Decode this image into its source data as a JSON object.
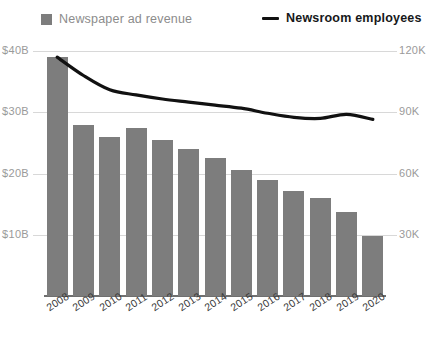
{
  "legend": {
    "bars": {
      "label": "Newspaper ad revenue",
      "icon": "square-swatch-icon",
      "color": "#7d7d7d"
    },
    "line": {
      "label": "Newsroom employees",
      "icon": "line-dash-icon",
      "color": "#111111"
    }
  },
  "axes": {
    "left": {
      "ticks": [
        "$40B",
        "$30B",
        "$20B",
        "$10B"
      ]
    },
    "right": {
      "ticks": [
        "120K",
        "90K",
        "60K",
        "30K"
      ]
    }
  },
  "chart_data": {
    "type": "bar",
    "title": "",
    "subtitle": "",
    "xlabel": "",
    "ylabel": "Newspaper ad revenue",
    "y2label": "Newsroom employees",
    "grid": true,
    "legend_position": "top",
    "categories": [
      "2008",
      "2009",
      "2010",
      "2011",
      "2012",
      "2013",
      "2014",
      "2015",
      "2016",
      "2017",
      "2018",
      "2019",
      "2020"
    ],
    "ylim": [
      0,
      40
    ],
    "ytick_labels": [
      "$10B",
      "$20B",
      "$30B",
      "$40B"
    ],
    "ytick_values": [
      10,
      20,
      30,
      40
    ],
    "y2lim": [
      0,
      120
    ],
    "y2tick_labels": [
      "30K",
      "60K",
      "90K",
      "120K"
    ],
    "y2tick_values": [
      30,
      60,
      90,
      120
    ],
    "series": [
      {
        "name": "Newspaper ad revenue",
        "type": "bar",
        "axis": "left",
        "unit": "billion USD",
        "color": "#7d7d7d",
        "values": [
          39.0,
          28.0,
          26.0,
          27.5,
          25.5,
          24.0,
          22.5,
          20.5,
          19.0,
          17.2,
          16.0,
          13.8,
          9.8
        ]
      },
      {
        "name": "Newsroom employees",
        "type": "line",
        "axis": "right",
        "unit": "thousand employees",
        "color": "#111111",
        "values": [
          117.0,
          108.0,
          101.0,
          98.5,
          96.5,
          95.0,
          93.5,
          92.0,
          89.5,
          87.5,
          87.0,
          89.0,
          86.5
        ]
      }
    ]
  }
}
